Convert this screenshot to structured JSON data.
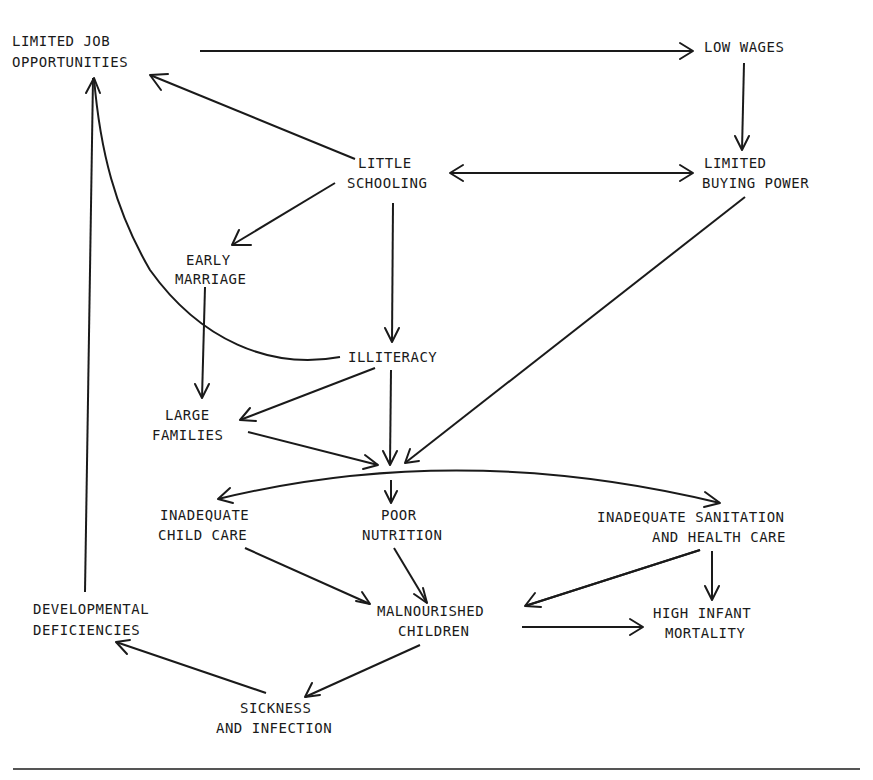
{
  "diagram": {
    "nodes": {
      "limited_job": {
        "line1": "LIMITED JOB",
        "line2": "OPPORTUNITIES"
      },
      "low_wages": {
        "line1": "LOW WAGES"
      },
      "little_schooling": {
        "line1": "LITTLE",
        "line2": "SCHOOLING"
      },
      "limited_buying": {
        "line1": "LIMITED",
        "line2": "BUYING POWER"
      },
      "early_marriage": {
        "line1": "EARLY",
        "line2": "MARRIAGE"
      },
      "illiteracy": {
        "line1": "ILLITERACY"
      },
      "large_families": {
        "line1": "LARGE",
        "line2": "FAMILIES"
      },
      "inadequate_child_care": {
        "line1": "INADEQUATE",
        "line2": "CHILD CARE"
      },
      "poor_nutrition": {
        "line1": "POOR",
        "line2": "NUTRITION"
      },
      "inadequate_sanitation": {
        "line1": "INADEQUATE SANITATION",
        "line2": "AND HEALTH CARE"
      },
      "developmental_deficiencies": {
        "line1": "DEVELOPMENTAL",
        "line2": "DEFICIENCIES"
      },
      "malnourished_children": {
        "line1": "MALNOURISHED",
        "line2": "CHILDREN"
      },
      "high_infant_mortality": {
        "line1": "HIGH INFANT",
        "line2": "MORTALITY"
      },
      "sickness_infection": {
        "line1": "SICKNESS",
        "line2": "AND INFECTION"
      }
    },
    "edges": [
      {
        "from": "LIMITED JOB OPPORTUNITIES",
        "to": "LOW WAGES"
      },
      {
        "from": "LOW WAGES",
        "to": "LIMITED BUYING POWER"
      },
      {
        "from": "LITTLE SCHOOLING",
        "to": "LIMITED BUYING POWER",
        "bidirectional": true
      },
      {
        "from": "LITTLE SCHOOLING",
        "to": "LIMITED JOB OPPORTUNITIES"
      },
      {
        "from": "LITTLE SCHOOLING",
        "to": "EARLY MARRIAGE"
      },
      {
        "from": "LITTLE SCHOOLING",
        "to": "ILLITERACY"
      },
      {
        "from": "ILLITERACY",
        "to": "LIMITED JOB OPPORTUNITIES"
      },
      {
        "from": "EARLY MARRIAGE",
        "to": "LARGE FAMILIES"
      },
      {
        "from": "ILLITERACY",
        "to": "LARGE FAMILIES"
      },
      {
        "from": "ILLITERACY",
        "to": "hub"
      },
      {
        "from": "LARGE FAMILIES",
        "to": "hub"
      },
      {
        "from": "LIMITED BUYING POWER",
        "to": "hub"
      },
      {
        "from": "hub",
        "to": "INADEQUATE CHILD CARE"
      },
      {
        "from": "hub",
        "to": "POOR NUTRITION"
      },
      {
        "from": "hub",
        "to": "INADEQUATE SANITATION AND HEALTH CARE"
      },
      {
        "from": "INADEQUATE CHILD CARE",
        "to": "MALNOURISHED CHILDREN"
      },
      {
        "from": "POOR NUTRITION",
        "to": "MALNOURISHED CHILDREN"
      },
      {
        "from": "INADEQUATE SANITATION AND HEALTH CARE",
        "to": "MALNOURISHED CHILDREN"
      },
      {
        "from": "INADEQUATE SANITATION AND HEALTH CARE",
        "to": "HIGH INFANT MORTALITY"
      },
      {
        "from": "MALNOURISHED CHILDREN",
        "to": "HIGH INFANT MORTALITY"
      },
      {
        "from": "MALNOURISHED CHILDREN",
        "to": "SICKNESS AND INFECTION"
      },
      {
        "from": "SICKNESS AND INFECTION",
        "to": "DEVELOPMENTAL DEFICIENCIES"
      },
      {
        "from": "DEVELOPMENTAL DEFICIENCIES",
        "to": "LIMITED JOB OPPORTUNITIES"
      }
    ]
  }
}
